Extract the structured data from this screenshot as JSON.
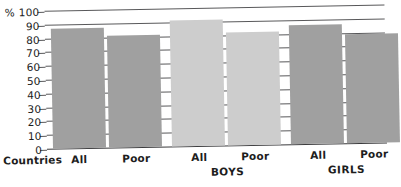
{
  "chart_data": {
    "type": "bar",
    "title": "",
    "subtitle": "",
    "xlabel": "",
    "ylabel": "% 100",
    "yunit": "%",
    "ylim": [
      0,
      100
    ],
    "grid": true,
    "legend_position": "none",
    "axis_top_label": "% 100",
    "yticks": [
      100,
      90,
      80,
      70,
      60,
      50,
      40,
      30,
      20,
      10,
      0
    ],
    "ytick_labels": [
      "% 100",
      "90",
      "80",
      "70",
      "60",
      "50",
      "40",
      "30",
      "20",
      "10",
      "0"
    ],
    "row_caption": "Countries",
    "groups": [
      {
        "name": "",
        "label": "",
        "color": "#a0a0a0",
        "categories": [
          "All",
          "Poor"
        ],
        "values": [
          87,
          81
        ]
      },
      {
        "name": "BOYS",
        "label": "BOYS",
        "color": "#cdcdcd",
        "categories": [
          "All",
          "Poor"
        ],
        "values": [
          91,
          82
        ]
      },
      {
        "name": "GIRLS",
        "label": "GIRLS",
        "color": "#a0a0a0",
        "categories": [
          "All",
          "Poor"
        ],
        "values": [
          86,
          79
        ]
      }
    ],
    "categories": [
      "All",
      "Poor",
      "All",
      "Poor",
      "All",
      "Poor"
    ],
    "values": [
      87,
      81,
      91,
      82,
      86,
      79
    ],
    "colors": {
      "bar_dark": "#a0a0a0",
      "bar_light": "#cdcdcd",
      "gridline": "#58585a",
      "text": "#1d1d1d",
      "background": "#ffffff"
    }
  }
}
